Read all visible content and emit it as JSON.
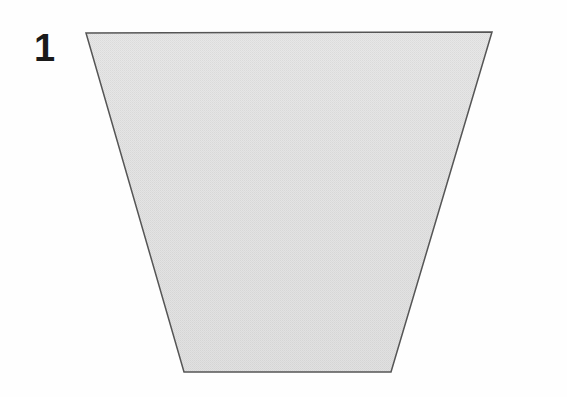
{
  "figure": {
    "label": "1",
    "label_color": "#1a1a1a",
    "background_color": "#fefefe",
    "caption": "",
    "shape": {
      "name": "trapezoid",
      "kind": "isosceles-trapezoid-inverted",
      "fill_color": "#dedede",
      "fill_color_top": "#e6e6e6",
      "fill_color_bottom": "#d8d8d8",
      "fill_texture": "fine-halftone-dither",
      "stroke_color": "#555555",
      "stroke_width": 1.5,
      "vertices": [
        {
          "name": "top-left",
          "x": 86,
          "y": 33
        },
        {
          "name": "top-right",
          "x": 492,
          "y": 32
        },
        {
          "name": "bottom-right",
          "x": 391,
          "y": 372
        },
        {
          "name": "bottom-left",
          "x": 184,
          "y": 372
        }
      ],
      "top_edge_length": 406,
      "bottom_edge_length": 207,
      "height": 340
    }
  },
  "canvas": {
    "width": 567,
    "height": 397
  }
}
